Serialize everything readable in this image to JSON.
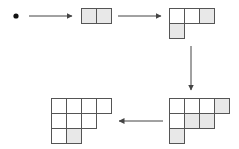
{
  "diagram": {
    "colors": {
      "line": "#555555",
      "shaded": "#e8e8e8",
      "empty": "#ffffff",
      "dot": "#111111",
      "arrow": "#444444"
    },
    "cell_size": 15,
    "start": {
      "type": "dot",
      "x": 16,
      "y": 16
    },
    "shapes": [
      {
        "id": "shape-2",
        "x": 81,
        "y": 8,
        "rows": [
          2
        ],
        "shaded": [
          [
            0,
            0
          ],
          [
            0,
            1
          ]
        ]
      },
      {
        "id": "shape-3-1",
        "x": 169,
        "y": 8,
        "rows": [
          3,
          1
        ],
        "shaded": [
          [
            0,
            2
          ],
          [
            1,
            0
          ]
        ]
      },
      {
        "id": "shape-4-3-1",
        "x": 169,
        "y": 98,
        "rows": [
          4,
          3,
          1
        ],
        "shaded": [
          [
            0,
            3
          ],
          [
            1,
            1
          ],
          [
            1,
            2
          ],
          [
            2,
            0
          ]
        ]
      },
      {
        "id": "shape-4-3-2",
        "x": 51,
        "y": 98,
        "rows": [
          4,
          3,
          2
        ],
        "shaded": [
          [
            2,
            1
          ]
        ]
      }
    ],
    "arrows": [
      {
        "id": "arrow-1",
        "x1": 29,
        "y1": 16,
        "x2": 72,
        "y2": 16
      },
      {
        "id": "arrow-2",
        "x1": 118,
        "y1": 16,
        "x2": 161,
        "y2": 16
      },
      {
        "id": "arrow-3",
        "x1": 191,
        "y1": 46,
        "x2": 191,
        "y2": 90
      },
      {
        "id": "arrow-4",
        "x1": 163,
        "y1": 121,
        "x2": 119,
        "y2": 121
      }
    ]
  }
}
